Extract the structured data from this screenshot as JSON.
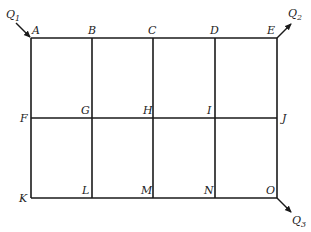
{
  "diagram": {
    "type": "pipe-network-grid",
    "grid": {
      "columns_x": [
        31,
        92,
        153,
        215,
        277
      ],
      "rows_y": [
        38,
        118,
        198
      ]
    },
    "nodes": [
      {
        "id": "A",
        "label": "A"
      },
      {
        "id": "B",
        "label": "B"
      },
      {
        "id": "C",
        "label": "C"
      },
      {
        "id": "D",
        "label": "D"
      },
      {
        "id": "E",
        "label": "E"
      },
      {
        "id": "F",
        "label": "F"
      },
      {
        "id": "G",
        "label": "G"
      },
      {
        "id": "H",
        "label": "H"
      },
      {
        "id": "I",
        "label": "I"
      },
      {
        "id": "J",
        "label": "J"
      },
      {
        "id": "K",
        "label": "K"
      },
      {
        "id": "L",
        "label": "L"
      },
      {
        "id": "M",
        "label": "M"
      },
      {
        "id": "N",
        "label": "N"
      },
      {
        "id": "O",
        "label": "O"
      }
    ],
    "flows": [
      {
        "id": "Q1",
        "label": "Q",
        "subscript": "1",
        "node": "A",
        "direction": "in"
      },
      {
        "id": "Q2",
        "label": "Q",
        "subscript": "2",
        "node": "E",
        "direction": "out"
      },
      {
        "id": "Q3",
        "label": "Q",
        "subscript": "3",
        "node": "O",
        "direction": "out"
      }
    ]
  }
}
